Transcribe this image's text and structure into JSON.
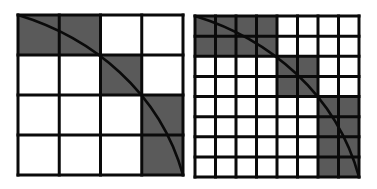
{
  "figure": {
    "colors": {
      "background": "#ffffff",
      "cell_fill": "#ffffff",
      "shaded_fill": "#5a5a5a",
      "grid_line": "#0a0a0a",
      "curve": "#0a0a0a"
    },
    "panels": [
      {
        "name": "coarse-grid",
        "rows": 4,
        "cols": 4,
        "x": 18,
        "y": 15,
        "width": 165,
        "height": 160,
        "line_width": 3,
        "curve_width": 2.6,
        "shaded_cells": [
          [
            0,
            0
          ],
          [
            0,
            1
          ],
          [
            1,
            2
          ],
          [
            2,
            3
          ],
          [
            3,
            3
          ]
        ]
      },
      {
        "name": "fine-grid",
        "rows": 8,
        "cols": 8,
        "x": 195,
        "y": 16,
        "width": 164,
        "height": 161,
        "line_width": 3,
        "curve_width": 2.6,
        "shaded_cells": [
          [
            0,
            0
          ],
          [
            0,
            1
          ],
          [
            0,
            2
          ],
          [
            0,
            3
          ],
          [
            1,
            0
          ],
          [
            1,
            1
          ],
          [
            1,
            2
          ],
          [
            1,
            3
          ],
          [
            2,
            4
          ],
          [
            2,
            5
          ],
          [
            3,
            4
          ],
          [
            3,
            5
          ],
          [
            4,
            6
          ],
          [
            4,
            7
          ],
          [
            5,
            6
          ],
          [
            5,
            7
          ],
          [
            6,
            6
          ],
          [
            6,
            7
          ],
          [
            7,
            6
          ],
          [
            7,
            7
          ]
        ]
      }
    ],
    "curve": {
      "from": [
        0,
        0
      ],
      "c1": [
        0.45,
        0.14
      ],
      "c2": [
        0.86,
        0.48
      ],
      "to": [
        1,
        1
      ]
    }
  }
}
